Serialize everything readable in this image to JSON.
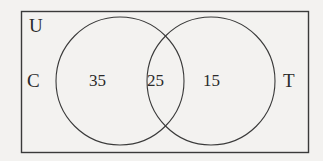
{
  "diagram": {
    "type": "venn-2-set",
    "universe": {
      "label": "U",
      "description": "universal set rectangle"
    },
    "sets": [
      {
        "id": "C",
        "label": "C",
        "only_count": "35"
      },
      {
        "id": "T",
        "label": "T",
        "only_count": "15"
      }
    ],
    "intersection": {
      "label": "C and T",
      "count": "25"
    },
    "regions": {
      "c_only": "35",
      "both": "25",
      "t_only": "15"
    },
    "style": {
      "background": "#f3f2f0",
      "stroke": "#3a3a3a",
      "text": "#2b2b2b",
      "stroke_width": 1
    },
    "geometry": {
      "rect": {
        "x": 21,
        "y": 11,
        "width": 287,
        "height": 141
      },
      "circle_left": {
        "cx": 120,
        "cy": 81,
        "r": 64
      },
      "circle_right": {
        "cx": 211,
        "cy": 81,
        "r": 64
      }
    }
  }
}
